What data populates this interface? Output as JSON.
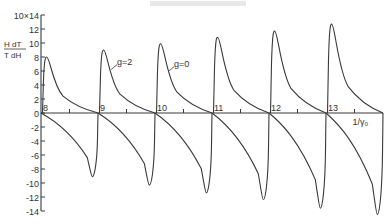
{
  "chart_data": {
    "type": "line",
    "title": "",
    "xlabel": "1/γ₀",
    "ylabel_num": "H dT",
    "ylabel_den": "T dH",
    "y_multiplier": "10×14",
    "xlim": [
      8,
      14
    ],
    "ylim": [
      -14,
      14
    ],
    "x_ticks": [
      8,
      9,
      10,
      11,
      12,
      13
    ],
    "y_ticks": [
      14,
      12,
      10,
      8,
      6,
      4,
      2,
      0,
      -2,
      -4,
      -6,
      -8,
      -10,
      -12,
      -14
    ],
    "y_tick_labels": [
      "10×14",
      "12",
      "10",
      "8",
      "6",
      "4",
      "2",
      "0",
      "-2",
      "-4",
      "-6",
      "-8",
      "-10",
      "-12",
      "-14"
    ],
    "grid": false,
    "series": [
      {
        "name": "g=2 (upper branches)",
        "peaks": [
          {
            "x": 8.1,
            "y": 8.0
          },
          {
            "x": 9.1,
            "y": 9.0
          },
          {
            "x": 10.1,
            "y": 9.9
          },
          {
            "x": 11.1,
            "y": 10.8
          },
          {
            "x": 12.1,
            "y": 11.7
          },
          {
            "x": 13.1,
            "y": 12.7
          }
        ]
      },
      {
        "name": "g=0 (lower branches)",
        "troughs": [
          {
            "x": 8.9,
            "y": -9.1
          },
          {
            "x": 9.9,
            "y": -10.3
          },
          {
            "x": 10.9,
            "y": -11.4
          },
          {
            "x": 11.9,
            "y": -12.4
          },
          {
            "x": 12.9,
            "y": -13.6
          },
          {
            "x": 13.9,
            "y": -14.5
          }
        ]
      }
    ],
    "annotations": [
      {
        "text": "g=2",
        "x": 9.3,
        "y": 6.5
      },
      {
        "text": "g=0",
        "x": 10.3,
        "y": 6.2
      }
    ]
  }
}
